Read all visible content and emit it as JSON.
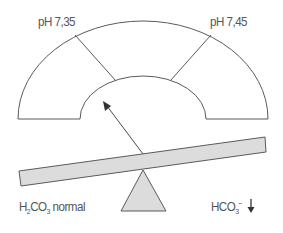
{
  "diagram": {
    "gauge": {
      "left_threshold_label": "pH 7,35",
      "right_threshold_label": "pH 7,45",
      "zones": [
        "acidosis",
        "normal",
        "alkalosis"
      ],
      "needle_direction": "toward acidosis (left zone)"
    },
    "seesaw": {
      "tilt": "left side down",
      "left_label": {
        "prefix": "H",
        "sub1": "2",
        "mid": "CO",
        "sub2": "3",
        "suffix": " normal"
      },
      "right_label": {
        "prefix": "HCO",
        "sub": "3",
        "sup": "−",
        "indicator": "down-arrow"
      }
    },
    "colors": {
      "stroke": "#5a5a5a",
      "fill": "#dcdcdc",
      "text": "#555555",
      "background": "#ffffff"
    }
  }
}
